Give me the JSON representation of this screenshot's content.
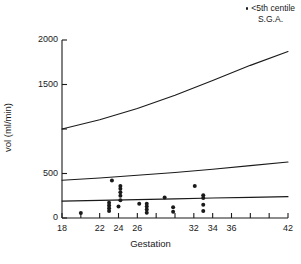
{
  "legend": {
    "marker": "point-marker",
    "line1": "<5th centile",
    "line2": "S.G.A."
  },
  "axes": {
    "xlabel": "Gestation",
    "ylabel": "vol (ml/min)"
  },
  "chart_data": {
    "type": "scatter",
    "title": "",
    "xlabel": "Gestation",
    "ylabel": "vol (ml/min)",
    "xlim": [
      18,
      42
    ],
    "ylim": [
      0,
      2000
    ],
    "grid": false,
    "legend_position": "top-right",
    "legend_entries": [
      "<5th centile S.G.A."
    ],
    "x_ticks": [
      18,
      20,
      22,
      24,
      26,
      28,
      30,
      32,
      34,
      36,
      38,
      40,
      42
    ],
    "x_tick_labels": [
      "18",
      "",
      "22",
      "24",
      "26",
      "",
      "",
      "32",
      "34",
      "36",
      "",
      "",
      "42"
    ],
    "y_ticks": [
      0,
      500,
      1000,
      1500,
      2000
    ],
    "y_tick_labels": [
      "0",
      "500",
      "",
      "1500",
      "2000"
    ],
    "points": [
      {
        "x": 20.0,
        "y": 55
      },
      {
        "x": 23.0,
        "y": 80
      },
      {
        "x": 23.0,
        "y": 110
      },
      {
        "x": 23.0,
        "y": 140
      },
      {
        "x": 23.0,
        "y": 170
      },
      {
        "x": 23.3,
        "y": 420
      },
      {
        "x": 24.0,
        "y": 130
      },
      {
        "x": 24.2,
        "y": 200
      },
      {
        "x": 24.2,
        "y": 250
      },
      {
        "x": 24.2,
        "y": 290
      },
      {
        "x": 24.2,
        "y": 330
      },
      {
        "x": 24.2,
        "y": 360
      },
      {
        "x": 26.2,
        "y": 160
      },
      {
        "x": 27.0,
        "y": 60
      },
      {
        "x": 27.0,
        "y": 95
      },
      {
        "x": 27.0,
        "y": 130
      },
      {
        "x": 27.0,
        "y": 160
      },
      {
        "x": 28.9,
        "y": 230
      },
      {
        "x": 29.8,
        "y": 70
      },
      {
        "x": 29.8,
        "y": 120
      },
      {
        "x": 32.1,
        "y": 360
      },
      {
        "x": 33.0,
        "y": 80
      },
      {
        "x": 33.0,
        "y": 150
      },
      {
        "x": 33.0,
        "y": 225
      },
      {
        "x": 33.0,
        "y": 255
      }
    ],
    "curves": [
      {
        "name": "upper-reference-curve",
        "points": [
          {
            "x": 18,
            "y": 1000
          },
          {
            "x": 22,
            "y": 1105
          },
          {
            "x": 26,
            "y": 1230
          },
          {
            "x": 30,
            "y": 1380
          },
          {
            "x": 34,
            "y": 1545
          },
          {
            "x": 38,
            "y": 1715
          },
          {
            "x": 42,
            "y": 1870
          }
        ]
      },
      {
        "name": "middle-reference-curve",
        "points": [
          {
            "x": 18,
            "y": 425
          },
          {
            "x": 22,
            "y": 450
          },
          {
            "x": 26,
            "y": 480
          },
          {
            "x": 30,
            "y": 512
          },
          {
            "x": 34,
            "y": 548
          },
          {
            "x": 38,
            "y": 588
          },
          {
            "x": 42,
            "y": 630
          }
        ]
      },
      {
        "name": "lower-reference-curve",
        "points": [
          {
            "x": 18,
            "y": 190
          },
          {
            "x": 22,
            "y": 198
          },
          {
            "x": 26,
            "y": 207
          },
          {
            "x": 30,
            "y": 215
          },
          {
            "x": 34,
            "y": 224
          },
          {
            "x": 38,
            "y": 232
          },
          {
            "x": 42,
            "y": 240
          }
        ]
      }
    ]
  },
  "colors": {
    "ink": "#1a1a1a",
    "background": "#ffffff"
  }
}
